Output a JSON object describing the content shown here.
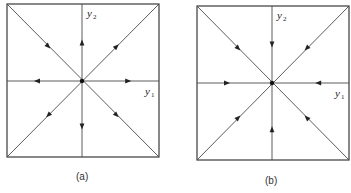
{
  "figure": {
    "panels": [
      {
        "id": "a",
        "caption": "(a)",
        "x_axis_label": "y",
        "x_axis_sub": "1",
        "y_axis_label": "y",
        "y_axis_sub": "2",
        "box": {
          "left": 7,
          "top": 4,
          "right": 159,
          "bottom": 157
        },
        "center": [
          82,
          81
        ],
        "arrow_directions": {
          "up": "outward",
          "down": "outward",
          "left": "outward",
          "right": "outward",
          "upper_left": "inward",
          "upper_right": "outward",
          "lower_left": "outward",
          "lower_right": "outward"
        }
      },
      {
        "id": "b",
        "caption": "(b)",
        "x_axis_label": "y",
        "x_axis_sub": "1",
        "y_axis_label": "y",
        "y_axis_sub": "2",
        "box": {
          "left": 197,
          "top": 6,
          "right": 349,
          "bottom": 160
        },
        "center": [
          272,
          83
        ],
        "arrow_directions": {
          "up": "inward",
          "down": "inward",
          "left": "inward",
          "right": "inward",
          "upper_left": "inward",
          "upper_right": "inward",
          "lower_left": "inward",
          "lower_right": "inward"
        }
      }
    ]
  }
}
